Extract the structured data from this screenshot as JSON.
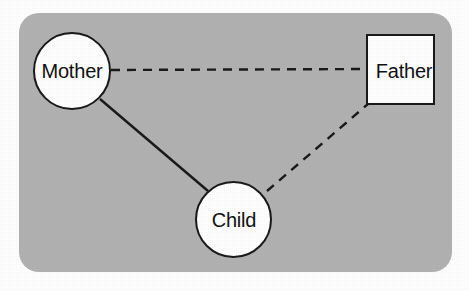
{
  "diagram": {
    "panel": {
      "background_color": "#b2b2b2",
      "corner_radius_px": 20
    },
    "stroke_color": "#1a1a1a",
    "node_fill_color": "#ffffff",
    "nodes": [
      {
        "id": "mother",
        "label": "Mother",
        "shape": "circle",
        "meaning": "female",
        "cx": 72,
        "cy": 71,
        "r": 39
      },
      {
        "id": "father",
        "label": "Father",
        "shape": "square",
        "meaning": "male",
        "cx": 400,
        "cy": 69,
        "width": 69,
        "height": 71
      },
      {
        "id": "child",
        "label": "Child",
        "shape": "circle",
        "meaning": "female",
        "cx": 233,
        "cy": 219,
        "r": 38
      }
    ],
    "edges": [
      {
        "id": "mother-father",
        "from": "mother",
        "to": "father",
        "style": "dashed",
        "x1": 111,
        "y1": 70,
        "x2": 366,
        "y2": 69
      },
      {
        "id": "mother-child",
        "from": "mother",
        "to": "child",
        "style": "solid",
        "x1": 100,
        "y1": 99,
        "x2": 208,
        "y2": 191
      },
      {
        "id": "child-father",
        "from": "child",
        "to": "father",
        "style": "dashed",
        "x1": 267,
        "y1": 191,
        "x2": 368,
        "y2": 104
      }
    ],
    "legend": {
      "solid_meaning": "solid line",
      "dashed_meaning": "dashed line"
    }
  }
}
